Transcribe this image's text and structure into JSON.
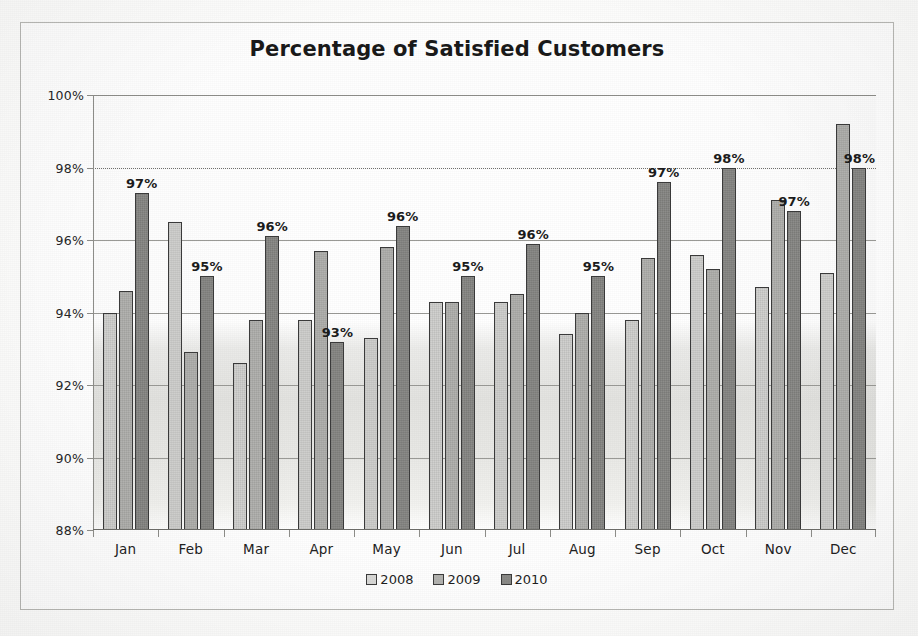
{
  "chart_data": {
    "type": "bar",
    "title": "Percentage of Satisfied Customers",
    "xlabel": "",
    "ylabel": "",
    "ylim": [
      88,
      100
    ],
    "yticks": [
      "88%",
      "90%",
      "92%",
      "94%",
      "96%",
      "98%",
      "100%"
    ],
    "ytick_values": [
      88,
      90,
      92,
      94,
      96,
      98,
      100
    ],
    "grid": true,
    "legend_position": "bottom",
    "categories": [
      "Jan",
      "Feb",
      "Mar",
      "Apr",
      "May",
      "Jun",
      "Jul",
      "Aug",
      "Sep",
      "Oct",
      "Nov",
      "Dec"
    ],
    "series": [
      {
        "name": "2008",
        "color": "#d2d2d0",
        "values": [
          94.0,
          96.5,
          92.6,
          93.8,
          93.3,
          94.3,
          94.3,
          93.4,
          93.8,
          95.6,
          94.7,
          95.1
        ]
      },
      {
        "name": "2009",
        "color": "#b2b2af",
        "values": [
          94.6,
          92.9,
          93.8,
          95.7,
          95.8,
          94.3,
          94.5,
          94.0,
          95.5,
          95.2,
          97.1,
          99.2
        ]
      },
      {
        "name": "2010",
        "color": "#888885",
        "values": [
          97.3,
          95.0,
          96.1,
          93.2,
          96.4,
          95.0,
          95.9,
          95.0,
          97.6,
          98.0,
          96.8,
          98.0
        ]
      }
    ],
    "data_labels": [
      "97%",
      "95%",
      "96%",
      "93%",
      "96%",
      "95%",
      "96%",
      "95%",
      "97%",
      "98%",
      "97%",
      "98%"
    ],
    "data_labels_series": "2010",
    "annotations": []
  }
}
